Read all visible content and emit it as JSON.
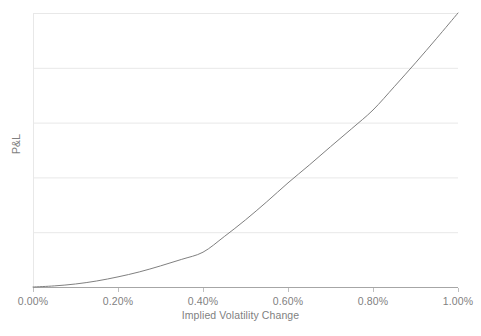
{
  "chart_data": {
    "type": "line",
    "title": "",
    "subtitle": "",
    "xlabel": "Implied Volatility Change",
    "ylabel": "P&L",
    "xlim": [
      0.0,
      1.0
    ],
    "ylim": [
      0.0,
      1.0
    ],
    "x_tick_labels": [
      "0.00%",
      "0.20%",
      "0.40%",
      "0.60%",
      "0.80%",
      "1.00%"
    ],
    "x_tick_values": [
      0.0,
      0.2,
      0.4,
      0.6,
      0.8,
      1.0
    ],
    "y_tick_labels": [],
    "y_gridline_values": [
      0.0,
      0.2,
      0.4,
      0.6,
      0.8,
      1.0
    ],
    "grid": "horizontal",
    "grid_color": "#e8e8e8",
    "legend": "none",
    "legend_position": "none",
    "annotations": [],
    "series": [
      {
        "name": "P&L",
        "color": "#808080",
        "line_width": 1,
        "x": [
          0.0,
          0.05,
          0.1,
          0.15,
          0.2,
          0.25,
          0.3,
          0.35,
          0.4,
          0.45,
          0.5,
          0.55,
          0.6,
          0.65,
          0.7,
          0.75,
          0.8,
          0.85,
          0.9,
          0.95,
          1.0
        ],
        "values": [
          0.0,
          0.004,
          0.011,
          0.022,
          0.037,
          0.055,
          0.077,
          0.101,
          0.127,
          0.184,
          0.245,
          0.311,
          0.38,
          0.445,
          0.512,
          0.578,
          0.646,
          0.731,
          0.818,
          0.908,
          1.0
        ]
      }
    ]
  },
  "axes": {
    "x_axis_line_color": "#a6a6a6",
    "tick_mark_color": "#bfbfbf",
    "x_ticks": [
      {
        "label": "0.00%",
        "left_px": 33
      },
      {
        "label": "0.20%",
        "left_px": 118
      },
      {
        "label": "0.40%",
        "left_px": 203
      },
      {
        "label": "0.60%",
        "left_px": 288
      },
      {
        "label": "0.80%",
        "left_px": 373
      },
      {
        "label": "1.00%",
        "left_px": 458
      }
    ],
    "x_title": "Implied Volatility Change",
    "y_title": "P&L"
  }
}
